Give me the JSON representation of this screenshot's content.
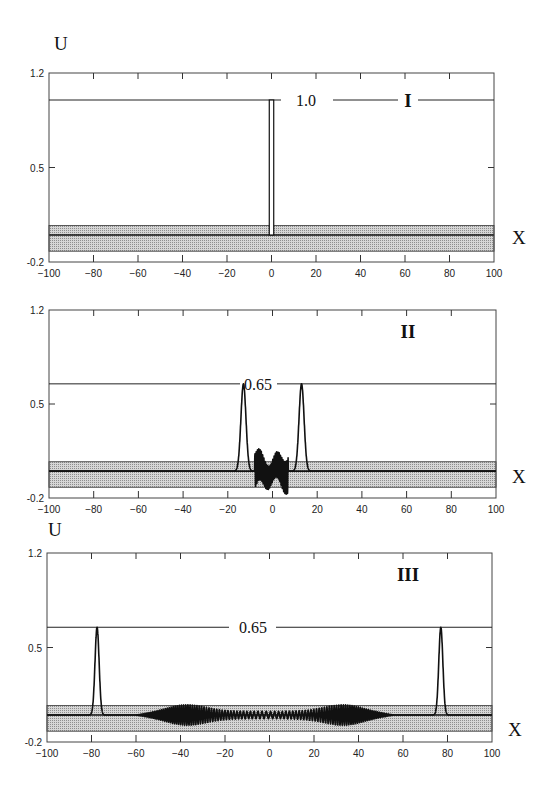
{
  "figure": {
    "y_axis_name": "U",
    "x_axis_name": "X"
  },
  "chart_data": [
    {
      "type": "line",
      "panel": "I",
      "title": "I",
      "xlabel": "X",
      "ylabel": "U",
      "xlim": [
        -100,
        100
      ],
      "ylim": [
        -0.2,
        1.2
      ],
      "xticks": [
        -100,
        -80,
        -60,
        -40,
        -20,
        0,
        20,
        40,
        60,
        80,
        100
      ],
      "yticks": [
        -0.2,
        0.5,
        1.2
      ],
      "ytick_labels": [
        "-0.2",
        "0.5",
        "1.2"
      ],
      "reference_line": {
        "y": 1.0,
        "label": "1.0"
      },
      "shaded_band": {
        "y_low": -0.12,
        "y_high": 0.07
      },
      "baseline": 0.0,
      "series": [
        {
          "name": "U(x)",
          "description": "narrow rectangular pulse of height 1.0 centered at x=0",
          "x": [
            -100,
            -1,
            -1,
            1,
            1,
            100
          ],
          "y": [
            0,
            0,
            1.0,
            1.0,
            0,
            0
          ]
        }
      ]
    },
    {
      "type": "line",
      "panel": "II",
      "title": "II",
      "xlabel": "X",
      "ylabel": "U",
      "xlim": [
        -100,
        100
      ],
      "ylim": [
        -0.2,
        1.2
      ],
      "xticks": [
        -100,
        -80,
        -60,
        -40,
        -20,
        0,
        20,
        40,
        60,
        80,
        100
      ],
      "yticks": [
        -0.2,
        0.5,
        1.2
      ],
      "ytick_labels": [
        "-0.2",
        "0.5",
        "1.2"
      ],
      "reference_line": {
        "y": 0.65,
        "label": "0.65"
      },
      "shaded_band": {
        "y_low": -0.12,
        "y_high": 0.07
      },
      "baseline": 0.0,
      "series": [
        {
          "name": "U(x)",
          "description": "two peaks of height 0.65 at x≈-13 and x≈+13 with dense oscillations between x≈-8 and x≈7",
          "peaks": [
            {
              "x": -13,
              "height": 0.65,
              "width": 1.6
            },
            {
              "x": 13,
              "height": 0.65,
              "width": 1.6
            }
          ],
          "oscillation": {
            "x_from": -8,
            "x_to": 7,
            "amplitude": 0.13
          }
        }
      ]
    },
    {
      "type": "line",
      "panel": "III",
      "title": "III",
      "xlabel": "X",
      "ylabel": "U",
      "xlim": [
        -100,
        100
      ],
      "ylim": [
        -0.2,
        1.2
      ],
      "xticks": [
        -100,
        -80,
        -60,
        -40,
        -20,
        0,
        20,
        40,
        60,
        80,
        100
      ],
      "yticks": [
        -0.2,
        0.5,
        1.2
      ],
      "ytick_labels": [
        "-0.2",
        "0.5",
        "1.2"
      ],
      "reference_line": {
        "y": 0.65,
        "label": "0.65"
      },
      "shaded_band": {
        "y_low": -0.12,
        "y_high": 0.07
      },
      "baseline": 0.0,
      "series": [
        {
          "name": "U(x)",
          "description": "two peaks of height 0.65 at x≈-77 and x≈+77 with oscillatory radiation between x≈-60 and x≈55",
          "peaks": [
            {
              "x": -77.5,
              "height": 0.65,
              "width": 1.3
            },
            {
              "x": 77,
              "height": 0.65,
              "width": 1.3
            }
          ],
          "oscillation": {
            "x_from": -60,
            "x_to": 56,
            "amplitude": 0.08
          }
        }
      ]
    }
  ]
}
